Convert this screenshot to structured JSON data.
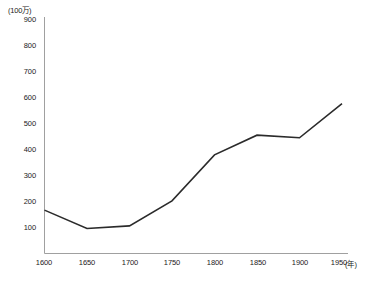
{
  "chart_data": {
    "type": "line",
    "title": "",
    "subtitle": "",
    "xlabel": "(年)",
    "ylabel": "(100万)",
    "unit_note": "(100万)",
    "x": [
      1600,
      1650,
      1700,
      1750,
      1800,
      1850,
      1900,
      1950
    ],
    "categories": [
      "1600",
      "1650",
      "1700",
      "1750",
      "1800",
      "1850",
      "1900",
      "1950"
    ],
    "values": [
      165,
      95,
      105,
      200,
      375,
      450,
      440,
      570
    ],
    "series": [
      {
        "name": "",
        "values": [
          165,
          95,
          105,
          200,
          375,
          450,
          440,
          570
        ],
        "color": "#2b2b2b"
      }
    ],
    "xlim": [
      1600,
      1950
    ],
    "ylim": [
      0,
      900
    ],
    "yticks": [
      100,
      200,
      300,
      400,
      500,
      600,
      700,
      800,
      900
    ],
    "ytick_labels": [
      "100",
      "200",
      "300",
      "400",
      "500",
      "600",
      "700",
      "800",
      "900"
    ],
    "xticks": [
      1600,
      1650,
      1700,
      1750,
      1800,
      1850,
      1900,
      1950
    ],
    "xtick_labels": [
      "1600",
      "1650",
      "1700",
      "1750",
      "1800",
      "1850",
      "1900",
      "1950"
    ],
    "grid": false,
    "legend": "none",
    "axis_color": "#9a9a9a",
    "line_color": "#2b2b2b",
    "background": "#ffffff"
  },
  "axes": {
    "y_unit_label": "(100万)",
    "x_unit_label": "(年)",
    "y_labels": [
      "900",
      "800",
      "700",
      "600",
      "500",
      "400",
      "300",
      "200",
      "100"
    ],
    "x_labels": [
      "1600",
      "1650",
      "1700",
      "1750",
      "1800",
      "1850",
      "1900",
      "1950"
    ]
  }
}
